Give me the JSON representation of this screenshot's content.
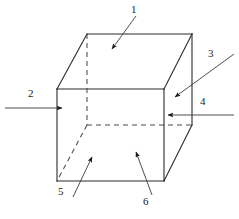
{
  "figure": {
    "type": "line-drawing",
    "background_color": "#ffffff",
    "line_color": "#2b2b2b",
    "dashed_line_color": "#4a4a4a",
    "text_color": "#1a1a1a",
    "canvas": {
      "width": 239,
      "height": 219
    }
  },
  "cube": {
    "description": "Isometric wireframe cube, hidden edges dashed",
    "vertices": {
      "front_top_left": [
        57,
        89
      ],
      "front_top_right": [
        164,
        89
      ],
      "front_bottom_left": [
        57,
        181
      ],
      "front_bottom_right": [
        164,
        181
      ],
      "back_top_left": [
        87,
        34
      ],
      "back_top_right": [
        192,
        34
      ],
      "back_bottom_left": [
        87,
        125
      ],
      "back_bottom_right": [
        192,
        125
      ]
    },
    "solid_edges": [
      "front_top_left-front_top_right",
      "front_top_right-front_bottom_right",
      "front_bottom_right-front_bottom_left",
      "front_bottom_left-front_top_left",
      "back_top_left-back_top_right",
      "back_top_right-back_bottom_right",
      "front_top_left-back_top_left",
      "front_top_right-back_top_right",
      "front_bottom_right-back_bottom_right"
    ],
    "hidden_edges": [
      "back_top_left-back_bottom_left",
      "back_bottom_left-back_bottom_right",
      "back_bottom_left-front_bottom_left"
    ]
  },
  "callouts": [
    {
      "id": "callout-1",
      "label": "1",
      "label_pos": [
        131,
        4
      ],
      "target": "top-face",
      "leader": {
        "x1": 136,
        "y1": 16,
        "x2": 112,
        "y2": 49
      },
      "arrow": "down-left"
    },
    {
      "id": "callout-2",
      "label": "2",
      "label_pos": [
        28,
        88
      ],
      "target": "left-face",
      "leader": {
        "x1": 5,
        "y1": 108,
        "x2": 62,
        "y2": 108
      },
      "arrow": "right"
    },
    {
      "id": "callout-3",
      "label": "3",
      "label_pos": [
        208,
        48
      ],
      "target": "right-face",
      "leader": {
        "x1": 234,
        "y1": 54,
        "x2": 175,
        "y2": 97
      },
      "arrow": "down-left"
    },
    {
      "id": "callout-4",
      "label": "4",
      "label_pos": [
        200,
        96
      ],
      "target": "right-face-inner",
      "leader": {
        "x1": 234,
        "y1": 115,
        "x2": 168,
        "y2": 115
      },
      "arrow": "left"
    },
    {
      "id": "callout-5",
      "label": "5",
      "label_pos": [
        58,
        186
      ],
      "target": "bottom-face-left",
      "leader": {
        "x1": 73,
        "y1": 197,
        "x2": 92,
        "y2": 157
      },
      "arrow": "up-right"
    },
    {
      "id": "callout-6",
      "label": "6",
      "label_pos": [
        143,
        196
      ],
      "target": "front-face",
      "leader": {
        "x1": 152,
        "y1": 195,
        "x2": 136,
        "y2": 152
      },
      "arrow": "up-left"
    }
  ]
}
